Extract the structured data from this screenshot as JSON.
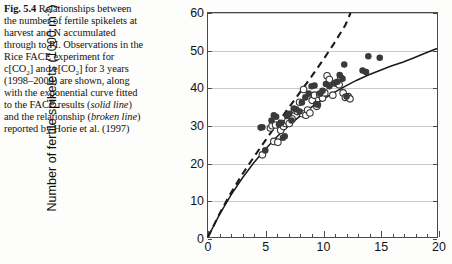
{
  "caption": {
    "figure_number": "Fig. 5.4",
    "text_segments": [
      {
        "t": " Relationships between the number of fertile spikelets at harvest and N accumulated through to PI. Observations in the Rice FACE experiment for c[CO"
      },
      {
        "t": "2",
        "sub": true
      },
      {
        "t": "] and e[CO"
      },
      {
        "t": "2",
        "sub": true
      },
      {
        "t": "] for 3 years (1998–2000) are shown, along with the exponential curve fitted to the FACE results ("
      },
      {
        "t": "solid line",
        "italic": true
      },
      {
        "t": ") and the relationship ("
      },
      {
        "t": "broken line",
        "italic": true
      },
      {
        "t": ") reported by Horie et al. (1997)"
      }
    ],
    "full_text": "Fig. 5.4 Relationships between the number of fertile spikelets at harvest and N accumulated through to PI. Observations in the Rice FACE experiment for c[CO2] and e[CO2] for 3 years (1998–2000) are shown, along with the exponential curve fitted to the FACE results (solid line) and the relationship (broken line) reported by Horie et al. (1997)"
  },
  "chart_data": {
    "type": "scatter",
    "title": "",
    "xlabel": "",
    "ylabel": "Number of fertile spikelets (1000 m",
    "ylabel_exponent": "-2",
    "ylabel_suffix": ")",
    "xlim": [
      0,
      20
    ],
    "ylim": [
      0,
      60
    ],
    "xticks": [
      0,
      5,
      10,
      15,
      20
    ],
    "yticks": [
      0,
      10,
      20,
      30,
      40,
      50,
      60
    ],
    "x_minor_step": 1,
    "grid": "horizontal",
    "legend_position": "inside-lower-right",
    "colors": {
      "open_marker_edge": "#333333",
      "open_marker_fill": "#ffffff",
      "filled_marker": "#3a3a3a",
      "fitted_line": "#1a1a1a",
      "horie_line": "#1a1a1a",
      "gridline": "#c8c8c8",
      "axis": "#4a4a4a"
    },
    "legend": [
      {
        "label": "c [CO",
        "sub": "2",
        "label_end": "]",
        "marker": "open-circle"
      },
      {
        "label": "e [CO",
        "sub": "2",
        "label_end": "]",
        "marker": "filled-circle"
      },
      {
        "label": "Fitted",
        "marker": "solid-line"
      },
      {
        "label": "Horie et al. (1997)",
        "marker": "dashed-line"
      }
    ],
    "series": [
      {
        "name": "c [CO2]",
        "marker": "open-circle",
        "points": [
          [
            4.75,
            22.0
          ],
          [
            5.45,
            29.2
          ],
          [
            5.6,
            29.8
          ],
          [
            5.75,
            25.6
          ],
          [
            5.9,
            30.0
          ],
          [
            6.1,
            25.4
          ],
          [
            6.35,
            28.6
          ],
          [
            6.6,
            29.6
          ],
          [
            6.75,
            30.4
          ],
          [
            6.95,
            31.0
          ],
          [
            7.1,
            30.4
          ],
          [
            7.35,
            31.6
          ],
          [
            7.55,
            34.0
          ],
          [
            7.8,
            33.6
          ],
          [
            8.0,
            36.1
          ],
          [
            8.25,
            33.0
          ],
          [
            8.35,
            39.5
          ],
          [
            8.55,
            32.6
          ],
          [
            8.7,
            34.0
          ],
          [
            8.9,
            33.2
          ],
          [
            9.1,
            36.6
          ],
          [
            9.3,
            38.0
          ],
          [
            9.5,
            35.0
          ],
          [
            9.75,
            38.2
          ],
          [
            10.0,
            37.2
          ],
          [
            10.2,
            38.6
          ],
          [
            10.4,
            43.2
          ],
          [
            10.6,
            42.2
          ],
          [
            10.9,
            38.0
          ],
          [
            11.2,
            41.2
          ],
          [
            11.45,
            40.8
          ],
          [
            11.6,
            42.6
          ],
          [
            11.8,
            38.6
          ],
          [
            12.0,
            37.4
          ],
          [
            12.25,
            37.6
          ],
          [
            12.4,
            37.0
          ]
        ]
      },
      {
        "name": "e [CO2]",
        "marker": "filled-circle",
        "points": [
          [
            4.6,
            29.3
          ],
          [
            4.75,
            29.4
          ],
          [
            5.0,
            23.2
          ],
          [
            5.55,
            31.2
          ],
          [
            5.75,
            32.6
          ],
          [
            5.95,
            32.2
          ],
          [
            6.2,
            30.2
          ],
          [
            6.4,
            30.6
          ],
          [
            6.55,
            26.6
          ],
          [
            6.7,
            27.0
          ],
          [
            6.9,
            32.4
          ],
          [
            7.1,
            33.0
          ],
          [
            7.3,
            31.2
          ],
          [
            7.5,
            34.4
          ],
          [
            7.7,
            34.2
          ],
          [
            8.0,
            33.6
          ],
          [
            8.2,
            36.0
          ],
          [
            8.5,
            37.4
          ],
          [
            8.8,
            38.4
          ],
          [
            9.05,
            40.4
          ],
          [
            9.3,
            40.6
          ],
          [
            9.45,
            35.6
          ],
          [
            9.6,
            35.4
          ],
          [
            9.8,
            38.4
          ],
          [
            10.0,
            39.2
          ],
          [
            10.3,
            41.0
          ],
          [
            10.6,
            40.4
          ],
          [
            11.0,
            41.2
          ],
          [
            11.3,
            41.6
          ],
          [
            11.5,
            43.4
          ],
          [
            11.75,
            42.4
          ],
          [
            11.9,
            46.2
          ],
          [
            12.1,
            37.6
          ],
          [
            13.5,
            44.6
          ],
          [
            13.8,
            44.2
          ],
          [
            14.0,
            48.4
          ],
          [
            15.0,
            48.0
          ]
        ]
      }
    ],
    "curves": [
      {
        "name": "Fitted",
        "style": "solid",
        "equation_note": "exponential saturating through origin",
        "points": [
          [
            0,
            0
          ],
          [
            1,
            6.0
          ],
          [
            2,
            11.2
          ],
          [
            3,
            15.8
          ],
          [
            4,
            19.9
          ],
          [
            5,
            23.5
          ],
          [
            6,
            26.8
          ],
          [
            7,
            29.7
          ],
          [
            8,
            32.3
          ],
          [
            9,
            34.7
          ],
          [
            10,
            36.8
          ],
          [
            11,
            38.7
          ],
          [
            12,
            40.4
          ],
          [
            13,
            42.0
          ],
          [
            14,
            43.4
          ],
          [
            15,
            44.6
          ],
          [
            16,
            45.8
          ],
          [
            17,
            46.8
          ],
          [
            18,
            48.0
          ],
          [
            19,
            49.3
          ],
          [
            20,
            50.5
          ]
        ]
      },
      {
        "name": "Horie et al. (1997)",
        "style": "dashed",
        "points": [
          [
            0,
            0
          ],
          [
            1,
            6.2
          ],
          [
            2,
            11.8
          ],
          [
            3,
            16.8
          ],
          [
            4,
            21.4
          ],
          [
            5,
            25.8
          ],
          [
            6,
            30.2
          ],
          [
            7,
            34.4
          ],
          [
            8,
            38.6
          ],
          [
            9,
            42.8
          ],
          [
            10,
            47.2
          ],
          [
            11,
            51.8
          ],
          [
            12,
            56.8
          ],
          [
            12.45,
            60.0
          ]
        ]
      }
    ]
  }
}
